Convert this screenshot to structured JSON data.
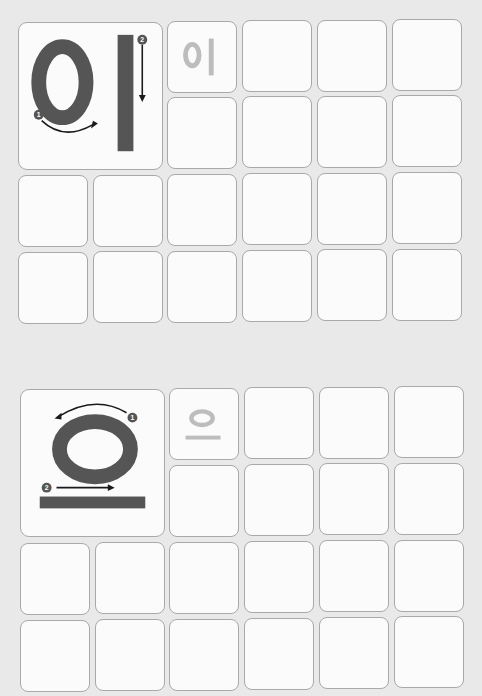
{
  "worksheet": {
    "sections": [
      {
        "syllable": "이",
        "demo": {
          "strokes": [
            {
              "number": "1",
              "shape": "circle-ㅇ",
              "direction": "counter-clockwise from top"
            },
            {
              "number": "2",
              "shape": "vertical-ㅣ",
              "direction": "top to bottom"
            }
          ]
        },
        "trace_example": "이",
        "grid": {
          "rows": 4,
          "cols": 6,
          "empty_cells": 19
        }
      },
      {
        "syllable": "으",
        "demo": {
          "strokes": [
            {
              "number": "1",
              "shape": "circle-ㅇ",
              "direction": "counter-clockwise from top"
            },
            {
              "number": "2",
              "shape": "horizontal-ㅡ",
              "direction": "left to right"
            }
          ]
        },
        "trace_example": "으",
        "grid": {
          "rows": 4,
          "cols": 6,
          "empty_cells": 19
        }
      }
    ],
    "colors": {
      "background": "#e9e9e9",
      "cell_fill": "#fbfbfb",
      "cell_border": "#a9a9a9",
      "demo_glyph": "#555555",
      "trace_glyph": "#bdbdbd",
      "arrow": "#1a1a1a",
      "stroke_number_badge": "#555555"
    }
  }
}
